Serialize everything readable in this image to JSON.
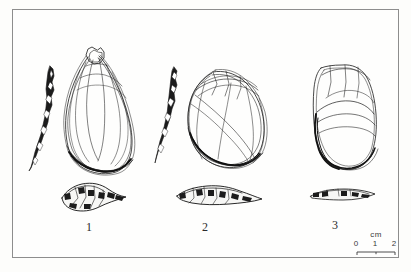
{
  "plate": {
    "caption_numbers": [
      "1",
      "2",
      "3"
    ],
    "background_color": "#fdfdfb",
    "ink_color": "#1a1a1a",
    "frame_color": "#8d8d8d"
  },
  "scale": {
    "unit": "cm",
    "ticks": [
      "0",
      "1",
      "2"
    ],
    "length_cm": 2
  },
  "artifacts": [
    {
      "number": "1",
      "views": [
        "lateral-profile",
        "dorsal-face",
        "basal-section"
      ]
    },
    {
      "number": "2",
      "views": [
        "lateral-profile",
        "dorsal-face",
        "basal-section"
      ]
    },
    {
      "number": "3",
      "views": [
        "dorsal-face",
        "basal-section"
      ]
    }
  ]
}
